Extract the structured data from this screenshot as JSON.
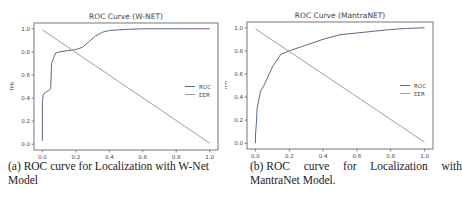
{
  "chart_data": [
    {
      "type": "line",
      "title": "ROC Curve (W-NET)",
      "xlabel": "FPR",
      "ylabel": "TPR",
      "xlim": [
        -0.05,
        1.05
      ],
      "ylim": [
        -0.05,
        1.05
      ],
      "xticks": [
        "0.0",
        "0.2",
        "0.4",
        "0.6",
        "0.8",
        "1.0"
      ],
      "yticks": [
        "0.0",
        "0.2",
        "0.4",
        "0.6",
        "0.8",
        "1.0"
      ],
      "grid": false,
      "legend_position": "center right",
      "series": [
        {
          "name": "ROC",
          "x": [
            0.0,
            0.0,
            0.005,
            0.01,
            0.02,
            0.04,
            0.05,
            0.055,
            0.06,
            0.08,
            0.1,
            0.15,
            0.2,
            0.24,
            0.28,
            0.32,
            0.36,
            0.4,
            0.5,
            0.6,
            0.8,
            1.0
          ],
          "y": [
            0.03,
            0.38,
            0.42,
            0.44,
            0.45,
            0.47,
            0.48,
            0.7,
            0.72,
            0.79,
            0.8,
            0.81,
            0.82,
            0.84,
            0.89,
            0.94,
            0.97,
            0.985,
            0.995,
            1.0,
            1.0,
            1.0
          ]
        },
        {
          "name": "EER",
          "x": [
            0.0,
            1.0
          ],
          "y": [
            0.99,
            0.01
          ]
        }
      ],
      "caption": "(a) ROC curve for Localization with W-Net Model"
    },
    {
      "type": "line",
      "title": "ROC Curve (MantraNET)",
      "xlabel": "FPR",
      "ylabel": "TPR",
      "xlim": [
        -0.05,
        1.05
      ],
      "ylim": [
        -0.05,
        1.05
      ],
      "xticks": [
        "0.0",
        "0.2",
        "0.4",
        "0.6",
        "0.8",
        "1.0"
      ],
      "yticks": [
        "0.0",
        "0.2",
        "0.4",
        "0.6",
        "0.8",
        "1.0"
      ],
      "grid": false,
      "legend_position": "center right",
      "series": [
        {
          "name": "ROC",
          "x": [
            0.0,
            0.0,
            0.005,
            0.01,
            0.03,
            0.05,
            0.1,
            0.15,
            0.2,
            0.3,
            0.4,
            0.5,
            0.6,
            0.7,
            0.8,
            0.9,
            1.0
          ],
          "y": [
            0.0,
            0.08,
            0.16,
            0.3,
            0.45,
            0.5,
            0.66,
            0.77,
            0.8,
            0.85,
            0.9,
            0.94,
            0.955,
            0.97,
            0.985,
            0.995,
            1.0
          ]
        },
        {
          "name": "EER",
          "x": [
            0.0,
            1.0
          ],
          "y": [
            0.99,
            0.01
          ]
        }
      ],
      "caption": "(b) ROC curve for Localization with MantraNet Model."
    }
  ],
  "captions": {
    "a_line1": "(a) ROC curve for Localization with W-Net",
    "a_line2": "Model",
    "b_words": [
      "(b) ROC",
      "curve",
      "for",
      "Localization",
      "with"
    ],
    "b_line2": "MantraNet Model."
  },
  "colors": {
    "roc": "#5a6c87",
    "eer": "#9aa29a",
    "axis": "#555555",
    "text": "#444444"
  }
}
